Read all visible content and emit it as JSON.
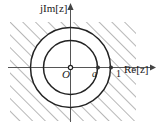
{
  "figure": {
    "type": "complex-plane-annulus",
    "axes": {
      "imaginary_label": "jIm[z]",
      "real_label": "Re[z]",
      "origin_label": "O",
      "vertical_axis_name": "imaginary-axis",
      "horizontal_axis_name": "real-axis"
    },
    "markers": [
      {
        "label": "a",
        "name": "point-a",
        "x_px": 98,
        "italic": true
      },
      {
        "label": "1",
        "name": "point-unit",
        "x_px": 111,
        "italic": false
      }
    ],
    "circles": [
      {
        "name": "inner-circle",
        "radius_px": 27,
        "label": "|z| = a"
      },
      {
        "name": "outer-circle",
        "radius_px": 40,
        "label": "|z| = 1"
      }
    ],
    "hatching": {
      "name": "hatched-region",
      "description": "diagonal hatch lines outside outer circle",
      "angle_deg": 45,
      "spacing_px": 9
    },
    "colors": {
      "stroke": "#2b2b2b",
      "hatch": "#6f6f6f",
      "background": "#ffffff",
      "axis": "#4a4a4a"
    }
  }
}
